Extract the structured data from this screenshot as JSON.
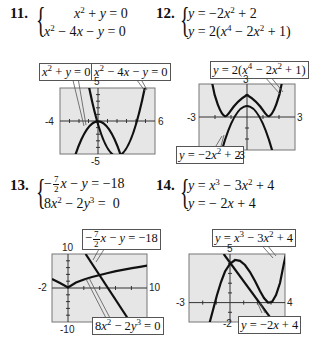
{
  "problems": [
    {
      "number": "11.",
      "equations": [
        "x^2 + y = 0",
        "x^2 - 4x - y = 0"
      ],
      "graph": {
        "window": {
          "xmin": "-4",
          "xmax": "6",
          "ymin": "-5",
          "ymax": "5"
        },
        "labels": [
          "x^2 + y = 0",
          "x^2 - 4x - y = 0"
        ]
      }
    },
    {
      "number": "12.",
      "equations": [
        "y = -2x^2 + 2",
        "y = 2(x^4 - 2x^2 + 1)"
      ],
      "graph": {
        "window": {
          "xmin": "-3",
          "xmax": "3",
          "ymin": "-3",
          "ymax": "3"
        },
        "labels": [
          "y = 2(x^4 - 2x^2 + 1)",
          "y = -2x^2 + 2"
        ]
      }
    },
    {
      "number": "13.",
      "equations": [
        "-(7/2)x - y = -18",
        "8x^2 - 2y^3 = 0"
      ],
      "graph": {
        "window": {
          "xmin": "-2",
          "xmax": "10",
          "ymin": "-10",
          "ymax": "10"
        },
        "labels": [
          "-(7/2)x - y = -18",
          "8x^2 - 2y^3 = 0"
        ]
      }
    },
    {
      "number": "14.",
      "equations": [
        "y = x^3 - 3x^2 + 4",
        "y = -2x + 4"
      ],
      "graph": {
        "window": {
          "xmin": "-3",
          "xmax": "4",
          "ymin": "-2",
          "ymax": "5"
        },
        "labels": [
          "y = x^3 - 3x^2 + 4",
          "y = -2x + 4"
        ]
      }
    }
  ],
  "colors": {
    "plot_bg": "#e6e6e6",
    "curve": "#111111",
    "frame": "#777777"
  }
}
